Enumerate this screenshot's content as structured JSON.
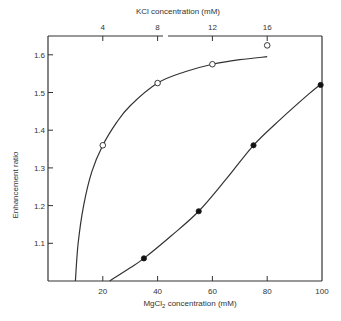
{
  "chart_data": {
    "type": "line",
    "title": "",
    "xlabel": "MgCl2 concentration (mM)",
    "xlabel_main": "MgCl",
    "xlabel_sub": "2",
    "xlabel_rest": " concentration  (mM)",
    "x2label": "KCl concentration  (mM)",
    "ylabel": "Enhancement ratio",
    "xlim": [
      0,
      100
    ],
    "ylim": [
      1.0,
      1.65
    ],
    "x_ticks": [
      20,
      40,
      60,
      80,
      100
    ],
    "x_tick_labels": [
      "20",
      "40",
      "60",
      "80",
      "100"
    ],
    "x2_ticks": [
      4,
      8,
      12,
      16
    ],
    "x2_tick_labels": [
      "4",
      "8",
      "12",
      "16"
    ],
    "x2_to_x_factor": 5,
    "y_ticks": [
      1.1,
      1.2,
      1.3,
      1.4,
      1.5,
      1.6
    ],
    "y_tick_labels": [
      "1.1",
      "1.2",
      "1.3",
      "1.4",
      "1.5",
      "1.6"
    ],
    "grid": false,
    "legend": null,
    "series": [
      {
        "name": "KCl (open circles, top axis)",
        "marker": "open-circle",
        "axis": "top",
        "x_kcl": [
          4,
          8,
          12,
          16
        ],
        "x": [
          20,
          40,
          60,
          80
        ],
        "y": [
          1.36,
          1.525,
          1.575,
          1.625
        ],
        "fit_curve": [
          [
            10,
            1.0
          ],
          [
            11,
            1.1
          ],
          [
            13,
            1.2
          ],
          [
            16,
            1.29
          ],
          [
            20,
            1.36
          ],
          [
            25,
            1.42
          ],
          [
            30,
            1.465
          ],
          [
            40,
            1.525
          ],
          [
            50,
            1.555
          ],
          [
            60,
            1.575
          ],
          [
            70,
            1.587
          ],
          [
            80,
            1.595
          ]
        ]
      },
      {
        "name": "MgCl2 (filled circles, bottom axis)",
        "marker": "filled-circle",
        "axis": "bottom",
        "x": [
          35,
          55,
          75,
          99.5
        ],
        "y": [
          1.06,
          1.185,
          1.36,
          1.52
        ],
        "fit_curve": [
          [
            22.5,
            1.0
          ],
          [
            30,
            1.035
          ],
          [
            35,
            1.06
          ],
          [
            45,
            1.12
          ],
          [
            55,
            1.185
          ],
          [
            65,
            1.27
          ],
          [
            75,
            1.36
          ],
          [
            85,
            1.43
          ],
          [
            95,
            1.495
          ],
          [
            100,
            1.525
          ]
        ]
      }
    ]
  }
}
